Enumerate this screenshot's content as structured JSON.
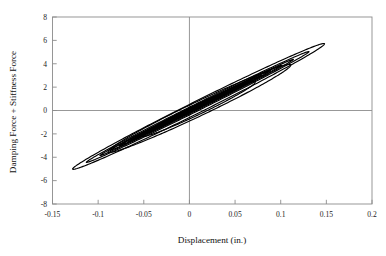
{
  "chart_data": {
    "type": "line",
    "title": "",
    "xlabel": "Displacement (in.)",
    "ylabel": "Damping Force + Stiffness Force",
    "xlim": [
      -0.15,
      0.2
    ],
    "ylim": [
      -8,
      8
    ],
    "xticks": [
      -0.15,
      -0.1,
      -0.05,
      0,
      0.05,
      0.1,
      0.15,
      0.2
    ],
    "xtick_labels": [
      "-0.15",
      "-0.1",
      "-0.05",
      "0",
      "0.05",
      "0.1",
      "0.15",
      "0.2"
    ],
    "yticks": [
      -8,
      -6,
      -4,
      -2,
      0,
      2,
      4,
      6,
      8
    ],
    "ytick_labels": [
      "-8",
      "-6",
      "-4",
      "-2",
      "0",
      "2",
      "4",
      "6",
      "8"
    ],
    "grid": false,
    "zero_axes": true,
    "legend": "none",
    "line_color": "#000000",
    "series": [
      {
        "name": "loop-1",
        "x_amplitude": 0.138,
        "y_amplitude": 5.35,
        "x_center": 0.01,
        "y_center": 0.35,
        "fatness": 0.105,
        "tilt_slope": 38.8,
        "x_extremes": [
          -0.128,
          0.148
        ],
        "y_extremes": [
          -5.0,
          5.7
        ]
      },
      {
        "name": "loop-2",
        "x_amplitude": 0.122,
        "y_amplitude": 4.75,
        "x_center": 0.009,
        "y_center": 0.3,
        "fatness": 0.07,
        "tilt_slope": 38.8,
        "x_extremes": [
          -0.113,
          0.131
        ],
        "y_extremes": [
          -4.45,
          5.05
        ]
      },
      {
        "name": "loop-3",
        "x_amplitude": 0.106,
        "y_amplitude": 4.12,
        "x_center": 0.008,
        "y_center": 0.26,
        "fatness": 0.058,
        "tilt_slope": 38.8,
        "x_extremes": [
          -0.098,
          0.114
        ],
        "y_extremes": [
          -3.86,
          4.38
        ]
      },
      {
        "name": "loop-4",
        "x_amplitude": 0.094,
        "y_amplitude": 3.66,
        "x_center": 0.007,
        "y_center": 0.23,
        "fatness": 0.05,
        "tilt_slope": 38.8,
        "x_extremes": [
          -0.087,
          0.101
        ],
        "y_extremes": [
          -3.43,
          3.89
        ]
      },
      {
        "name": "loop-5",
        "x_amplitude": 0.083,
        "y_amplitude": 3.22,
        "x_center": 0.006,
        "y_center": 0.2,
        "fatness": 0.045,
        "tilt_slope": 38.8,
        "x_extremes": [
          -0.077,
          0.089
        ],
        "y_extremes": [
          -3.02,
          3.42
        ]
      },
      {
        "name": "loop-6",
        "x_amplitude": 0.073,
        "y_amplitude": 2.84,
        "x_center": 0.006,
        "y_center": 0.18,
        "fatness": 0.042,
        "tilt_slope": 38.8,
        "x_extremes": [
          -0.067,
          0.079
        ],
        "y_extremes": [
          -2.66,
          3.02
        ]
      },
      {
        "name": "loop-7",
        "x_amplitude": 0.064,
        "y_amplitude": 2.48,
        "x_center": 0.005,
        "y_center": 0.16,
        "fatness": 0.04,
        "tilt_slope": 38.8,
        "x_extremes": [
          -0.059,
          0.069
        ],
        "y_extremes": [
          -2.32,
          2.64
        ]
      },
      {
        "name": "loop-8",
        "x_amplitude": 0.056,
        "y_amplitude": 2.17,
        "x_center": 0.005,
        "y_center": 0.14,
        "fatness": 0.038,
        "tilt_slope": 38.8,
        "x_extremes": [
          -0.051,
          0.061
        ],
        "y_extremes": [
          -2.03,
          2.31
        ]
      },
      {
        "name": "loop-9",
        "x_amplitude": 0.049,
        "y_amplitude": 1.9,
        "x_center": 0.004,
        "y_center": 0.12,
        "fatness": 0.036,
        "tilt_slope": 38.8,
        "x_extremes": [
          -0.045,
          0.053
        ],
        "y_extremes": [
          -1.78,
          2.02
        ]
      },
      {
        "name": "loop-10",
        "x_amplitude": 0.043,
        "y_amplitude": 1.67,
        "x_center": 0.004,
        "y_center": 0.11,
        "fatness": 0.034,
        "tilt_slope": 38.8,
        "x_extremes": [
          -0.039,
          0.047
        ],
        "y_extremes": [
          -1.56,
          1.78
        ]
      },
      {
        "name": "loop-11",
        "x_amplitude": 0.037,
        "y_amplitude": 1.44,
        "x_center": 0.003,
        "y_center": 0.09,
        "fatness": 0.032,
        "tilt_slope": 38.8,
        "x_extremes": [
          -0.034,
          0.04
        ],
        "y_extremes": [
          -1.35,
          1.53
        ]
      },
      {
        "name": "loop-12",
        "x_amplitude": 0.032,
        "y_amplitude": 1.24,
        "x_center": 0.003,
        "y_center": 0.08,
        "fatness": 0.03,
        "tilt_slope": 38.8,
        "x_extremes": [
          -0.029,
          0.035
        ],
        "y_extremes": [
          -1.16,
          1.32
        ]
      },
      {
        "name": "loop-13",
        "x_amplitude": 0.027,
        "y_amplitude": 1.05,
        "x_center": 0.002,
        "y_center": 0.07,
        "fatness": 0.028,
        "tilt_slope": 38.8,
        "x_extremes": [
          -0.025,
          0.029
        ],
        "y_extremes": [
          -0.98,
          1.12
        ]
      },
      {
        "name": "loop-14",
        "x_amplitude": 0.022,
        "y_amplitude": 0.85,
        "x_center": 0.002,
        "y_center": 0.06,
        "fatness": 0.026,
        "tilt_slope": 38.8,
        "x_extremes": [
          -0.02,
          0.024
        ],
        "y_extremes": [
          -0.79,
          0.91
        ]
      },
      {
        "name": "loop-15",
        "x_amplitude": 0.017,
        "y_amplitude": 0.66,
        "x_center": 0.002,
        "y_center": 0.04,
        "fatness": 0.024,
        "tilt_slope": 38.8,
        "x_extremes": [
          -0.015,
          0.019
        ],
        "y_extremes": [
          -0.62,
          0.7
        ]
      },
      {
        "name": "loop-16",
        "x_amplitude": 0.013,
        "y_amplitude": 0.5,
        "x_center": 0.001,
        "y_center": 0.03,
        "fatness": 0.022,
        "tilt_slope": 38.8,
        "x_extremes": [
          -0.012,
          0.014
        ],
        "y_extremes": [
          -0.47,
          0.53
        ]
      },
      {
        "name": "loop-inner-a",
        "x_amplitude": 0.1,
        "y_amplitude": 3.7,
        "x_center": 0.011,
        "y_center": 0.18,
        "fatness": 0.185,
        "tilt_slope": 37.0,
        "x_extremes": [
          -0.089,
          0.111
        ],
        "y_extremes": [
          -3.52,
          3.88
        ]
      },
      {
        "name": "loop-inner-b",
        "x_amplitude": 0.062,
        "y_amplitude": 2.3,
        "x_center": 0.01,
        "y_center": 0.12,
        "fatness": 0.21,
        "tilt_slope": 37.0,
        "x_extremes": [
          -0.052,
          0.072
        ],
        "y_extremes": [
          -2.18,
          2.42
        ]
      }
    ]
  },
  "axes": {
    "x_title": "Displacement (in.)",
    "y_title": "Damping Force + Stiffness Force"
  }
}
